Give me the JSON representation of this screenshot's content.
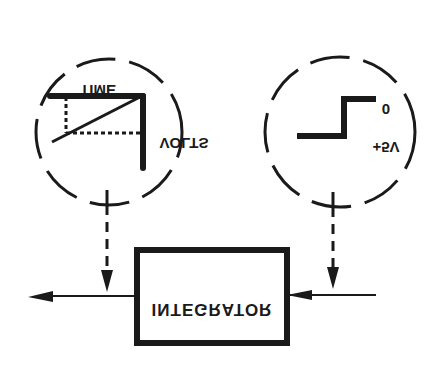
{
  "diagram": {
    "orientation": "vertically-flipped",
    "colors": {
      "ink": "#1a1a1a",
      "background": "#ffffff"
    },
    "integrator": {
      "label": "INTEGRATOR"
    },
    "ramp_inset": {
      "title": "Ramp output waveform",
      "x_axis_label": "TIME",
      "y_axis_label": "VOLTS"
    },
    "step_inset": {
      "title": "Step input waveform",
      "high_label": "0",
      "low_label": "+5V"
    },
    "connections": [
      {
        "from": "input-line",
        "to": "integrator",
        "label": ""
      },
      {
        "from": "integrator",
        "to": "output-line",
        "label": ""
      },
      {
        "from": "step-inset",
        "to": "input-line",
        "label": ""
      },
      {
        "from": "ramp-inset",
        "to": "output-line",
        "label": ""
      }
    ]
  }
}
